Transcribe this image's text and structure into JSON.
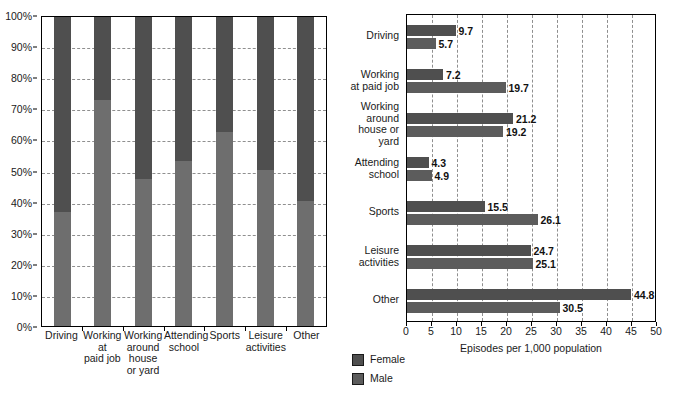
{
  "chart_data": [
    {
      "type": "bar",
      "id": "left-stacked",
      "orientation": "vertical",
      "stacked": true,
      "normalized": "100%",
      "title": "",
      "xlabel": "",
      "ylabel": "",
      "ylim": [
        0,
        100
      ],
      "grid": true,
      "legend_position": "below-center",
      "categories": [
        "Driving",
        "Working\nat\npaid job",
        "Working\naround\nhouse\nor yard",
        "Attending\nschool",
        "Sports",
        "Leisure\nactivities",
        "Other"
      ],
      "ytick_labels": [
        "0%",
        "10%",
        "20%",
        "30%",
        "40%",
        "50%",
        "60%",
        "70%",
        "80%",
        "90%",
        "100%"
      ],
      "ytick_values": [
        0,
        10,
        20,
        30,
        40,
        50,
        60,
        70,
        80,
        90,
        100
      ],
      "series": [
        {
          "name": "Male",
          "values": [
            37.0,
            73.2,
            47.5,
            53.3,
            62.7,
            50.4,
            40.5
          ]
        },
        {
          "name": "Female",
          "values": [
            63.0,
            26.8,
            52.5,
            46.7,
            37.3,
            49.6,
            59.5
          ]
        }
      ]
    },
    {
      "type": "bar",
      "id": "right-grouped",
      "orientation": "horizontal",
      "stacked": false,
      "title": "",
      "xlabel": "Episodes per 1,000 population",
      "ylabel": "",
      "xlim": [
        0,
        50
      ],
      "grid": true,
      "legend_position": "below-left",
      "categories": [
        "Driving",
        "Working\nat paid job",
        "Working\naround\nhouse or\nyard",
        "Attending\nschool",
        "Sports",
        "Leisure\nactivities",
        "Other"
      ],
      "xtick_labels": [
        "0",
        "5",
        "10",
        "15",
        "20",
        "25",
        "30",
        "35",
        "40",
        "45",
        "50"
      ],
      "xtick_values": [
        0,
        5,
        10,
        15,
        20,
        25,
        30,
        35,
        40,
        45,
        50
      ],
      "series": [
        {
          "name": "Female",
          "values": [
            9.7,
            7.2,
            21.2,
            4.3,
            15.5,
            24.7,
            44.8
          ]
        },
        {
          "name": "Male",
          "values": [
            5.7,
            19.7,
            19.2,
            4.9,
            26.1,
            25.1,
            30.5
          ]
        }
      ]
    }
  ],
  "legend": {
    "items": [
      {
        "label": "Female",
        "color": "#4f4f4f"
      },
      {
        "label": "Male",
        "color": "#5c5c5c"
      }
    ]
  },
  "colors": {
    "female": "#4f4f4f",
    "male": "#6e6e6e",
    "axis": "#000000",
    "gridline": "#8f8f8f",
    "text": "#1a1a1a",
    "background": "#ffffff"
  }
}
